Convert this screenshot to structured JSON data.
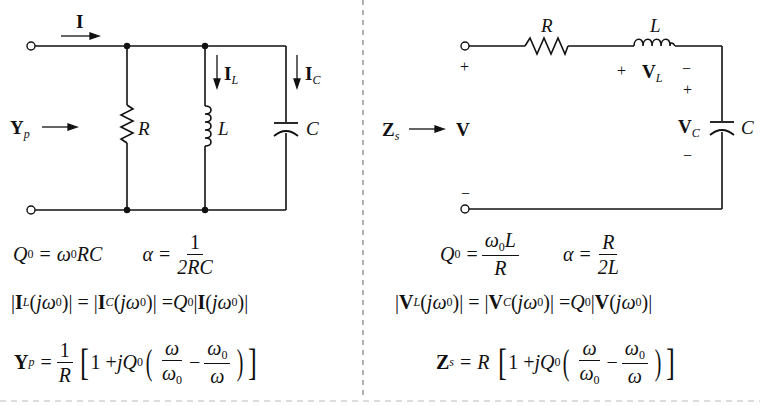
{
  "parallel_circuit": {
    "current_label": "I",
    "admittance_label": "Y",
    "admittance_sub": "p",
    "resistor_label": "R",
    "inductor_label": "L",
    "capacitor_label": "C",
    "inductor_current_label": "I",
    "inductor_current_sub": "L",
    "capacitor_current_label": "I",
    "capacitor_current_sub": "C"
  },
  "series_circuit": {
    "impedance_label": "Z",
    "impedance_sub": "s",
    "voltage_label": "V",
    "resistor_label": "R",
    "inductor_label": "L",
    "capacitor_label": "C",
    "inductor_voltage_label": "V",
    "inductor_voltage_sub": "L",
    "capacitor_voltage_label": "V",
    "capacitor_voltage_sub": "C",
    "plus": "+",
    "minus": "−"
  },
  "parallel_formulas": {
    "q0": {
      "lhs": "Q",
      "lhs_sub": "0",
      "eq": "=",
      "rhs": "ω",
      "rhs_sub": "0",
      "rhs_tail": "RC"
    },
    "alpha": {
      "lhs": "α",
      "eq": "=",
      "num": "1",
      "den": "2RC"
    },
    "resonance": "|I_L(jω0)| = |I_C(jω0)| = Q0|I(jω0)|",
    "admittance": {
      "lhs": "Y",
      "lhs_sub": "p",
      "eq": "=",
      "num": "1",
      "den": "R",
      "body": "1 + jQ0(ω/ω0 − ω0/ω)"
    }
  },
  "series_formulas": {
    "q0": {
      "lhs": "Q",
      "lhs_sub": "0",
      "eq": "=",
      "num": "ω0L",
      "den": "R"
    },
    "alpha": {
      "lhs": "α",
      "eq": "=",
      "num": "R",
      "den": "2L"
    },
    "resonance": "|V_L(jω0)| = |V_C(jω0)| = Q0|V(jω0)|",
    "impedance": {
      "lhs": "Z",
      "lhs_sub": "s",
      "eq": "=",
      "factor": "R",
      "body": "1 + jQ0(ω/ω0 − ω0/ω)"
    }
  },
  "colors": {
    "ink": "#111111",
    "background": "#ffffff",
    "divider": "#888888"
  }
}
